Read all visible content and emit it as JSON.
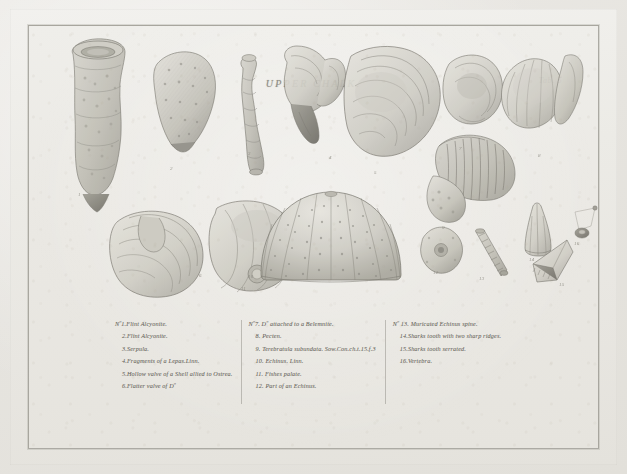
{
  "plate": {
    "title": "UPPER CHALK.",
    "number_label": "Tab. 5",
    "paper_color": "#ecebe6",
    "ink_color": "#6e6c65",
    "border_color": "#74726a"
  },
  "figure_numbers": [
    "1",
    "2",
    "3",
    "4",
    "5",
    "6",
    "7",
    "8",
    "9",
    "10",
    "11",
    "12",
    "13",
    "14",
    "15",
    "16"
  ],
  "captions": {
    "columns": [
      {
        "name": "column-one",
        "lines": [
          {
            "text": "Nº1.Flint Alcyonite.",
            "indent": false
          },
          {
            "text": "2.Flint Alcyonite.",
            "indent": true
          },
          {
            "text": "3.Serpula.",
            "indent": true
          },
          {
            "text": "4.Fragments of a Lepas.Linn.",
            "indent": true
          },
          {
            "text": "5.Hollow valve of a Shell allied to Ostrea.",
            "indent": true
          },
          {
            "text": "6.Flatter valve of  Dº",
            "indent": true
          }
        ]
      },
      {
        "name": "column-two",
        "lines": [
          {
            "text": "Nº7. Dº attached to a Belemnite.",
            "indent": false
          },
          {
            "text": "8. Pecten.",
            "indent": true
          },
          {
            "text": "9. Terebratula subundata. Sow.Con.ch.t.15.f.3",
            "indent": true
          },
          {
            "text": "10. Echinus. Linn.",
            "indent": true
          },
          {
            "text": "11. Fishes palate.",
            "indent": true
          },
          {
            "text": "12. Part of an Echinus.",
            "indent": true
          }
        ]
      },
      {
        "name": "column-three",
        "lines": [
          {
            "text": "Nº 13. Muricated Echinus spine.",
            "indent": false
          },
          {
            "text": "14.Sharks tooth with two sharp ridges.",
            "indent": true
          },
          {
            "text": "15.Sharks tooth  serrated.",
            "indent": true
          },
          {
            "text": "16.Vertebra.",
            "indent": true
          }
        ]
      }
    ]
  }
}
